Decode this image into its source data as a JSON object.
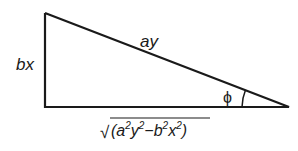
{
  "diagram": {
    "type": "right-triangle",
    "labels": {
      "vertical_side": "bx",
      "hypotenuse": "ay",
      "angle": "ϕ",
      "base": {
        "radical": "√",
        "open": "(",
        "a": "a",
        "a_exp": "2",
        "y": "y",
        "y_exp": "2",
        "minus": "−",
        "b": "b",
        "b_exp": "2",
        "x": "x",
        "x_exp": "2",
        "close": ")"
      }
    },
    "colors": {
      "stroke": "#1a1a1a",
      "background": "#ffffff"
    }
  }
}
